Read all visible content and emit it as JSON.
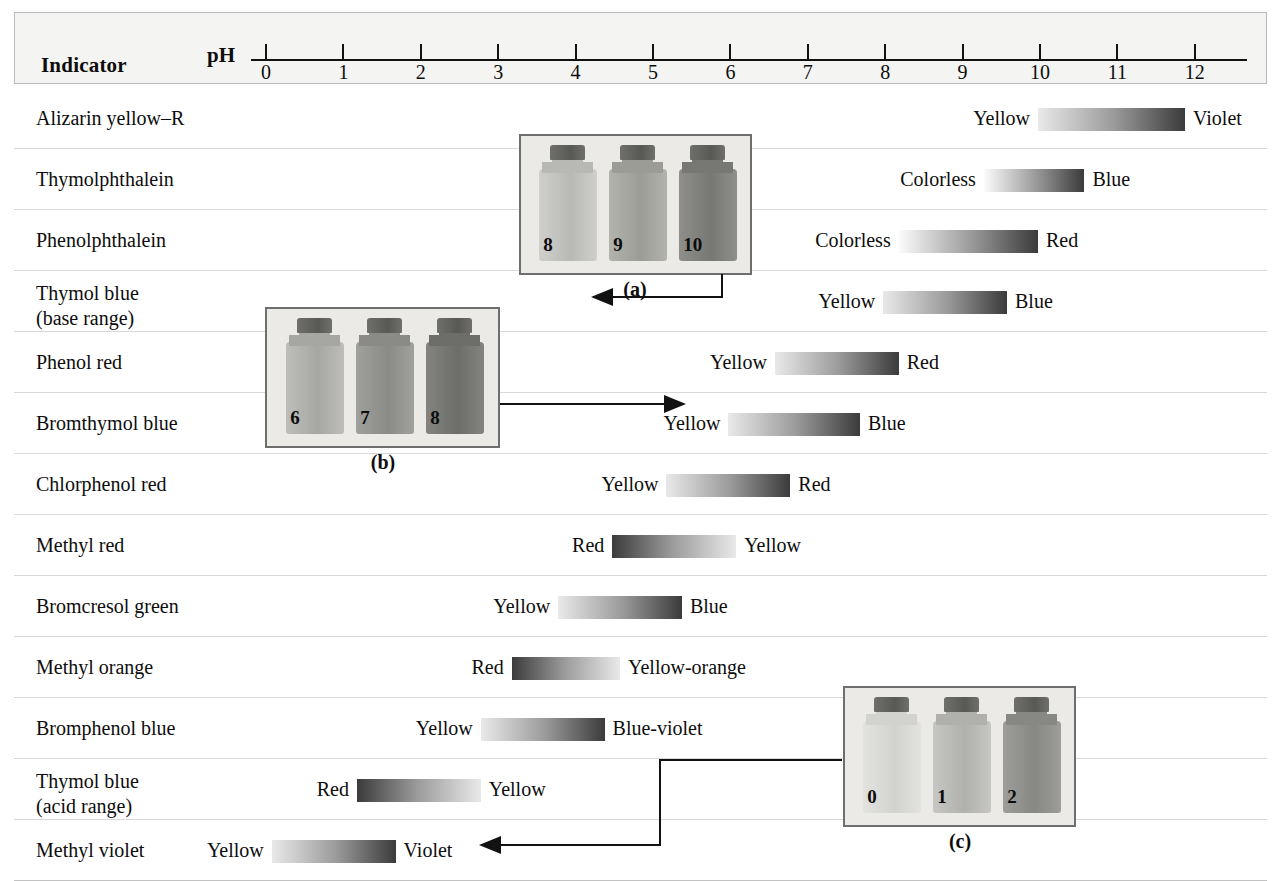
{
  "header": {
    "indicator_label": "Indicator",
    "ph_label": "pH",
    "axis_ticks": [
      0,
      1,
      2,
      3,
      4,
      5,
      6,
      7,
      8,
      9,
      10,
      11,
      12
    ]
  },
  "chart_data": {
    "type": "bar",
    "title": "Indicator",
    "xlabel": "pH",
    "xlim": [
      0,
      12
    ],
    "grid": false,
    "legend": null,
    "categories": [
      "Alizarin yellow–R",
      "Thymolphthalein",
      "Phenolphthalein",
      "Thymol blue (base range)",
      "Phenol red",
      "Bromthymol blue",
      "Chlorphenol red",
      "Methyl red",
      "Bromcresol green",
      "Methyl orange",
      "Bromphenol blue",
      "Thymol blue (acid range)",
      "Methyl violet"
    ],
    "ranges": [
      {
        "indicator": "Alizarin yellow–R",
        "acid_color": "Yellow",
        "base_color": "Violet",
        "ph_low": 10.0,
        "ph_high": 11.9,
        "dark_end": "right"
      },
      {
        "indicator": "Thymolphthalein",
        "acid_color": "Colorless",
        "base_color": "Blue",
        "ph_low": 9.3,
        "ph_high": 10.6,
        "dark_end": "right"
      },
      {
        "indicator": "Phenolphthalein",
        "acid_color": "Colorless",
        "base_color": "Red",
        "ph_low": 8.2,
        "ph_high": 10.0,
        "dark_end": "right"
      },
      {
        "indicator": "Thymol blue (base range)",
        "acid_color": "Yellow",
        "base_color": "Blue",
        "ph_low": 8.0,
        "ph_high": 9.6,
        "dark_end": "right"
      },
      {
        "indicator": "Phenol red",
        "acid_color": "Yellow",
        "base_color": "Red",
        "ph_low": 6.6,
        "ph_high": 8.2,
        "dark_end": "right"
      },
      {
        "indicator": "Bromthymol blue",
        "acid_color": "Yellow",
        "base_color": "Blue",
        "ph_low": 6.0,
        "ph_high": 7.7,
        "dark_end": "right"
      },
      {
        "indicator": "Chlorphenol red",
        "acid_color": "Yellow",
        "base_color": "Red",
        "ph_low": 5.2,
        "ph_high": 6.8,
        "dark_end": "right"
      },
      {
        "indicator": "Methyl red",
        "acid_color": "Red",
        "base_color": "Yellow",
        "ph_low": 4.5,
        "ph_high": 6.1,
        "dark_end": "left"
      },
      {
        "indicator": "Bromcresol green",
        "acid_color": "Yellow",
        "base_color": "Blue",
        "ph_low": 3.8,
        "ph_high": 5.4,
        "dark_end": "right"
      },
      {
        "indicator": "Methyl orange",
        "acid_color": "Red",
        "base_color": "Yellow-orange",
        "ph_low": 3.2,
        "ph_high": 4.6,
        "dark_end": "left"
      },
      {
        "indicator": "Bromphenol blue",
        "acid_color": "Yellow",
        "base_color": "Blue-violet",
        "ph_low": 2.8,
        "ph_high": 4.4,
        "dark_end": "right"
      },
      {
        "indicator": "Thymol blue (acid range)",
        "acid_color": "Red",
        "base_color": "Yellow",
        "ph_low": 1.2,
        "ph_high": 2.8,
        "dark_end": "left"
      },
      {
        "indicator": "Methyl violet",
        "acid_color": "Yellow",
        "base_color": "Violet",
        "ph_low": 0.1,
        "ph_high": 1.7,
        "dark_end": "right"
      }
    ]
  },
  "rows": [
    {
      "name": "Alizarin yellow–R",
      "left_label": "Yellow",
      "right_label": "Violet"
    },
    {
      "name": "Thymolphthalein",
      "left_label": "Colorless",
      "right_label": "Blue"
    },
    {
      "name": "Phenolphthalein",
      "left_label": "Colorless",
      "right_label": "Red"
    },
    {
      "name": "Thymol blue\n(base range)",
      "left_label": "Yellow",
      "right_label": "Blue"
    },
    {
      "name": "Phenol red",
      "left_label": "Yellow",
      "right_label": "Red"
    },
    {
      "name": "Bromthymol blue",
      "left_label": "Yellow",
      "right_label": "Blue"
    },
    {
      "name": "Chlorphenol red",
      "left_label": "Yellow",
      "right_label": "Red"
    },
    {
      "name": "Methyl red",
      "left_label": "Red",
      "right_label": "Yellow"
    },
    {
      "name": "Bromcresol green",
      "left_label": "Yellow",
      "right_label": "Blue"
    },
    {
      "name": "Methyl orange",
      "left_label": "Red",
      "right_label": "Yellow-orange"
    },
    {
      "name": "Bromphenol blue",
      "left_label": "Yellow",
      "right_label": "Blue-violet"
    },
    {
      "name": "Thymol blue\n(acid range)",
      "left_label": "Red",
      "right_label": "Yellow"
    },
    {
      "name": "Methyl violet",
      "left_label": "Yellow",
      "right_label": "Violet"
    }
  ],
  "photos": [
    {
      "caption": "(a)",
      "bottles": [
        "8",
        "9",
        "10"
      ]
    },
    {
      "caption": "(b)",
      "bottles": [
        "6",
        "7",
        "8"
      ]
    },
    {
      "caption": "(c)",
      "bottles": [
        "0",
        "1",
        "2"
      ]
    }
  ],
  "colors": {
    "bar_light": "#e9e9e9",
    "bar_mid": "#9a9a9a",
    "bar_dark": "#3b3b3b",
    "bar_colorless": "#fbfbfb",
    "rule": "#d8d8d8",
    "border": "#b9b9b9",
    "ink": "#121212",
    "photo_bg": "#eceae6"
  }
}
